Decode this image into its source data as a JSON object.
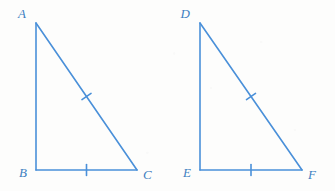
{
  "figure": {
    "stroke_color": "#4a90d9",
    "label_color": "#3d7fc1",
    "background_color": "#fdfdfc",
    "stroke_width": 1.6,
    "shapes": [
      {
        "name": "triangle-abc",
        "vertices": [
          {
            "label": "A",
            "x": 36,
            "y": 23,
            "label_x": 26,
            "label_y": 18,
            "anchor": "end"
          },
          {
            "label": "B",
            "x": 36,
            "y": 170,
            "label_x": 27,
            "label_y": 177,
            "anchor": "end"
          },
          {
            "label": "C",
            "x": 137,
            "y": 170,
            "label_x": 143,
            "label_y": 179,
            "anchor": "start"
          }
        ],
        "sides": [
          {
            "name": "leg-ab",
            "from": "A",
            "to": "B",
            "ticks": 0
          },
          {
            "name": "base-bc",
            "from": "B",
            "to": "C",
            "ticks": 1
          },
          {
            "name": "hypotenuse-ac",
            "from": "A",
            "to": "C",
            "ticks": 1
          }
        ]
      },
      {
        "name": "triangle-def",
        "vertices": [
          {
            "label": "D",
            "x": 200,
            "y": 23,
            "label_x": 190,
            "label_y": 18,
            "anchor": "end"
          },
          {
            "label": "E",
            "x": 200,
            "y": 170,
            "label_x": 191,
            "label_y": 177,
            "anchor": "end"
          },
          {
            "label": "F",
            "x": 302,
            "y": 170,
            "label_x": 308,
            "label_y": 179,
            "anchor": "start"
          }
        ],
        "sides": [
          {
            "name": "leg-de",
            "from": "D",
            "to": "E",
            "ticks": 0
          },
          {
            "name": "base-ef",
            "from": "E",
            "to": "F",
            "ticks": 1
          },
          {
            "name": "hypotenuse-df",
            "from": "D",
            "to": "F",
            "ticks": 1
          }
        ]
      }
    ],
    "tick_length": 11
  }
}
